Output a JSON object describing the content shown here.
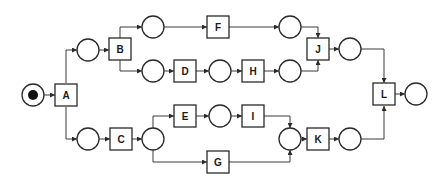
{
  "diagram": {
    "type": "petri-net",
    "places": [
      {
        "id": "p0",
        "x": 33,
        "y": 95,
        "token": true
      },
      {
        "id": "p1",
        "x": 88,
        "y": 50
      },
      {
        "id": "p2",
        "x": 88,
        "y": 139
      },
      {
        "id": "p3",
        "x": 153,
        "y": 27
      },
      {
        "id": "p4",
        "x": 153,
        "y": 71
      },
      {
        "id": "p5",
        "x": 220,
        "y": 71
      },
      {
        "id": "p6",
        "x": 290,
        "y": 27
      },
      {
        "id": "p7",
        "x": 290,
        "y": 71
      },
      {
        "id": "p8",
        "x": 350,
        "y": 49
      },
      {
        "id": "p9",
        "x": 153,
        "y": 139
      },
      {
        "id": "p10",
        "x": 220,
        "y": 116
      },
      {
        "id": "p11",
        "x": 290,
        "y": 139
      },
      {
        "id": "p12",
        "x": 350,
        "y": 139
      },
      {
        "id": "p13",
        "x": 416,
        "y": 94
      }
    ],
    "transitions": [
      {
        "id": "A",
        "label": "A",
        "x": 66,
        "y": 95
      },
      {
        "id": "B",
        "label": "B",
        "x": 120,
        "y": 49
      },
      {
        "id": "C",
        "label": "C",
        "x": 121,
        "y": 139
      },
      {
        "id": "D",
        "label": "D",
        "x": 185,
        "y": 71
      },
      {
        "id": "E",
        "label": "E",
        "x": 185,
        "y": 116
      },
      {
        "id": "F",
        "label": "F",
        "x": 218,
        "y": 27
      },
      {
        "id": "G",
        "label": "G",
        "x": 218,
        "y": 162
      },
      {
        "id": "H",
        "label": "H",
        "x": 253,
        "y": 71
      },
      {
        "id": "I",
        "label": "I",
        "x": 253,
        "y": 116
      },
      {
        "id": "J",
        "label": "J",
        "x": 318,
        "y": 49
      },
      {
        "id": "K",
        "label": "K",
        "x": 318,
        "y": 139
      },
      {
        "id": "L",
        "label": "L",
        "x": 384,
        "y": 94
      }
    ],
    "arcs": [
      [
        "p0",
        "A"
      ],
      [
        "A",
        "p1"
      ],
      [
        "A",
        "p2"
      ],
      [
        "p1",
        "B"
      ],
      [
        "B",
        "p3"
      ],
      [
        "B",
        "p4"
      ],
      [
        "p3",
        "F"
      ],
      [
        "F",
        "p6"
      ],
      [
        "p4",
        "D"
      ],
      [
        "D",
        "p5"
      ],
      [
        "p5",
        "H"
      ],
      [
        "H",
        "p7"
      ],
      [
        "p6",
        "J"
      ],
      [
        "p7",
        "J"
      ],
      [
        "J",
        "p8"
      ],
      [
        "p8",
        "L"
      ],
      [
        "p2",
        "C"
      ],
      [
        "C",
        "p9"
      ],
      [
        "p9",
        "E"
      ],
      [
        "E",
        "p10"
      ],
      [
        "p10",
        "I"
      ],
      [
        "I",
        "p11"
      ],
      [
        "p9",
        "G"
      ],
      [
        "G",
        "p11"
      ],
      [
        "p11",
        "K"
      ],
      [
        "K",
        "p12"
      ],
      [
        "p12",
        "L"
      ],
      [
        "L",
        "p13"
      ]
    ]
  }
}
